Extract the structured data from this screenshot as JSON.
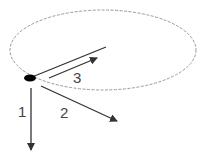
{
  "diagram": {
    "colors": {
      "ellipse": "#9a9a9a",
      "arrow": "#333333",
      "dot": "#000000",
      "label": "#444444"
    },
    "labels": {
      "arrow1": "1",
      "arrow2": "2",
      "arrow3": "3"
    }
  }
}
